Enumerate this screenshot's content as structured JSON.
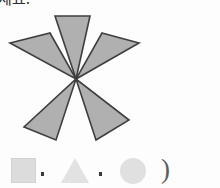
{
  "page": {
    "background_color": "#fdfdfd",
    "header_text": "세요."
  },
  "figure": {
    "name": "pinwheel-five-triangles",
    "fill_color": "#b0b0b0",
    "stroke_color": "#3f3f3f",
    "stroke_width": "1.6",
    "center": {
      "x": 70,
      "y": 66
    },
    "triangle_count": 5,
    "triangles": [
      {
        "label": "top",
        "points": "49,3 84,3 70,66"
      },
      {
        "label": "upper-left",
        "points": "4,30 44,20 70,66"
      },
      {
        "label": "upper-right",
        "points": "96,20 133,30 70,66"
      },
      {
        "label": "lower-left",
        "points": "18,114 50,127 70,66"
      },
      {
        "label": "lower-right",
        "points": "90,127 123,107 70,66"
      }
    ]
  },
  "options": {
    "items": [
      {
        "id": "square",
        "icon": "square-shape",
        "color": "#dcdcdc"
      },
      {
        "id": "sep1",
        "icon": "comma-separator",
        "text": ","
      },
      {
        "id": "triangle",
        "icon": "triangle-shape",
        "color": "#e2e2e2"
      },
      {
        "id": "sep2",
        "icon": "comma-separator",
        "text": ","
      },
      {
        "id": "circle",
        "icon": "circle-shape",
        "color": "#e0e0e0"
      },
      {
        "id": "paren",
        "icon": "close-paren",
        "text": ")"
      }
    ],
    "close_paren": ")"
  }
}
